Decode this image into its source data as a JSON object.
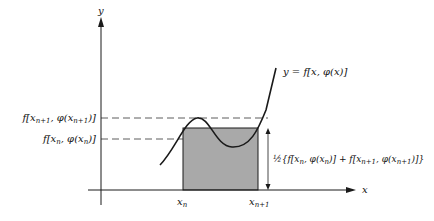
{
  "diagram": {
    "axes": {
      "x_label": "x",
      "y_label": "y"
    },
    "curve_label": "y = f[x, φ(x)]",
    "y_labels": {
      "upper": "f[x_{n+1}, φ(x_{n+1})]",
      "upper_parts": {
        "f": "f[x",
        "sub1": "n+1",
        "mid": ", φ(x",
        "sub2": "n+1",
        "end": ")]"
      },
      "lower": "f[x_n, φ(x_n)]",
      "lower_parts": {
        "f": "f[x",
        "sub1": "n",
        "mid": ", φ(x",
        "sub2": "n",
        "end": ")]"
      }
    },
    "x_ticks": {
      "left": {
        "base": "x",
        "sub": "n"
      },
      "right": {
        "base": "x",
        "sub": "n+1"
      }
    },
    "height_annotation": {
      "text": "½{f[x_n, φ(x_n)] + f[x_{n+1}, φ(x_{n+1})]}",
      "prefix": "½{f[x",
      "s1": "n",
      "p2": ", φ(x",
      "s2": "n",
      "p3": ")] + f[x",
      "s3": "n+1",
      "p4": ", φ(x",
      "s4": "n+1",
      "p5": ")]}"
    },
    "colors": {
      "shade": "#a9a9a9",
      "line": "#1a1a1a"
    }
  }
}
